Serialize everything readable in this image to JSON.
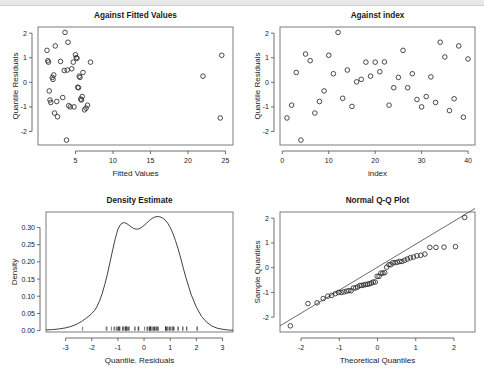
{
  "chart_data": [
    {
      "type": "scatter",
      "title": "Against Fitted Values",
      "xlabel": "Fitted Values",
      "ylabel": "Quantile Residuals",
      "xlim": [
        0.0,
        26.0
      ],
      "ylim": [
        -2.55,
        2.25
      ],
      "xticks": [
        5,
        10,
        15,
        20,
        25
      ],
      "yticks": [
        -2,
        -1,
        0,
        1,
        2
      ],
      "grid": false,
      "legend": "none",
      "x": [
        1.2,
        1.3,
        1.4,
        1.5,
        1.6,
        1.7,
        1.9,
        2.0,
        2.1,
        2.2,
        2.3,
        2.5,
        2.6,
        3.0,
        3.3,
        3.5,
        3.6,
        3.8,
        3.9,
        4.0,
        4.1,
        4.3,
        4.5,
        4.7,
        4.8,
        5.0,
        5.1,
        5.2,
        5.3,
        5.4,
        5.5,
        5.6,
        5.7,
        5.8,
        5.9,
        6.0,
        6.2,
        6.4,
        6.6,
        7.0,
        22.0,
        24.3,
        24.5
      ],
      "y": [
        1.3,
        0.88,
        0.82,
        -0.35,
        -0.72,
        -0.82,
        0.2,
        0.12,
        0.3,
        -1.25,
        1.48,
        -0.78,
        -1.4,
        0.85,
        -0.62,
        0.48,
        2.03,
        -2.35,
        0.5,
        1.63,
        -0.95,
        -1.0,
        0.55,
        0.82,
        -1.0,
        1.12,
        1.0,
        0.98,
        -0.2,
        -0.22,
        0.25,
        0.2,
        -0.68,
        -0.72,
        -0.58,
        0.4,
        -1.12,
        -1.05,
        -0.93,
        0.82,
        0.25,
        -1.45,
        1.1
      ]
    },
    {
      "type": "scatter",
      "title": "Against  index",
      "xlabel": "index",
      "ylabel": "Quantile Residuals",
      "xlim": [
        -0.5,
        41.5
      ],
      "ylim": [
        -2.55,
        2.25
      ],
      "xticks": [
        0,
        10,
        20,
        30,
        40
      ],
      "yticks": [
        -2,
        -1,
        0,
        1,
        2
      ],
      "grid": false,
      "legend": "none",
      "x": [
        1,
        2,
        3,
        4,
        5,
        6,
        7,
        8,
        9,
        10,
        11,
        12,
        13,
        14,
        15,
        16,
        17,
        18,
        19,
        20,
        21,
        22,
        23,
        24,
        25,
        26,
        27,
        28,
        29,
        30,
        31,
        32,
        33,
        34,
        35,
        36,
        37,
        38,
        39,
        40
      ],
      "y": [
        -1.45,
        -0.93,
        0.4,
        -2.35,
        1.15,
        0.88,
        -1.25,
        -0.78,
        -0.35,
        1.1,
        0.35,
        2.03,
        -0.65,
        0.5,
        -0.98,
        0.02,
        0.12,
        0.82,
        0.25,
        0.82,
        0.43,
        0.83,
        -0.93,
        -0.22,
        0.2,
        1.3,
        -0.22,
        0.35,
        -0.7,
        -1.0,
        -0.58,
        0.22,
        -0.82,
        1.63,
        1.03,
        -1.15,
        -0.67,
        1.48,
        -1.42,
        0.95
      ]
    },
    {
      "type": "line",
      "title": "Density Estimate",
      "xlabel": "Quantile. Residuals",
      "ylabel": "Density",
      "xlim": [
        -3.75,
        3.4
      ],
      "ylim": [
        -0.004,
        0.345
      ],
      "xticks": [
        -3,
        -2,
        -1,
        0,
        1,
        2,
        3
      ],
      "yticks": [
        0.0,
        0.05,
        0.1,
        0.15,
        0.2,
        0.25,
        0.3
      ],
      "ytick_labels": [
        "0.00",
        "0.05",
        "0.10",
        "0.15",
        "0.20",
        "0.25",
        "0.30"
      ],
      "grid": false,
      "legend": "none",
      "x": [
        -3.75,
        -3.5,
        -3.25,
        -3.0,
        -2.8,
        -2.6,
        -2.4,
        -2.25,
        -2.1,
        -2.0,
        -1.9,
        -1.8,
        -1.7,
        -1.6,
        -1.5,
        -1.4,
        -1.3,
        -1.2,
        -1.1,
        -1.0,
        -0.9,
        -0.8,
        -0.7,
        -0.6,
        -0.5,
        -0.4,
        -0.3,
        -0.2,
        -0.1,
        0.0,
        0.1,
        0.2,
        0.3,
        0.4,
        0.5,
        0.6,
        0.7,
        0.8,
        0.9,
        1.0,
        1.1,
        1.2,
        1.3,
        1.4,
        1.5,
        1.6,
        1.8,
        2.0,
        2.2,
        2.4,
        2.6,
        2.8,
        3.0,
        3.2,
        3.4
      ],
      "y": [
        0.002,
        0.003,
        0.005,
        0.008,
        0.012,
        0.018,
        0.026,
        0.034,
        0.043,
        0.05,
        0.058,
        0.07,
        0.087,
        0.108,
        0.135,
        0.165,
        0.2,
        0.235,
        0.268,
        0.295,
        0.309,
        0.314,
        0.313,
        0.308,
        0.302,
        0.297,
        0.295,
        0.296,
        0.3,
        0.306,
        0.313,
        0.32,
        0.326,
        0.33,
        0.332,
        0.331,
        0.328,
        0.322,
        0.313,
        0.3,
        0.283,
        0.262,
        0.238,
        0.211,
        0.182,
        0.154,
        0.105,
        0.068,
        0.041,
        0.024,
        0.013,
        0.007,
        0.004,
        0.002,
        0.001
      ],
      "rug": [
        -2.35,
        -1.45,
        -1.42,
        -1.25,
        -1.15,
        -1.12,
        -1.05,
        -1.0,
        -1.0,
        -0.98,
        -0.95,
        -0.93,
        -0.93,
        -0.82,
        -0.82,
        -0.78,
        -0.72,
        -0.72,
        -0.7,
        -0.68,
        -0.67,
        -0.65,
        -0.62,
        -0.58,
        -0.58,
        -0.35,
        -0.35,
        -0.22,
        -0.22,
        -0.2,
        0.02,
        0.12,
        0.12,
        0.2,
        0.2,
        0.2,
        0.22,
        0.25,
        0.25,
        0.25,
        0.3,
        0.35,
        0.35,
        0.4,
        0.4,
        0.43,
        0.48,
        0.5,
        0.5,
        0.55,
        0.82,
        0.82,
        0.82,
        0.83,
        0.85,
        0.88,
        0.88,
        0.95,
        0.98,
        1.0,
        1.03,
        1.1,
        1.1,
        1.12,
        1.15,
        1.3,
        1.3,
        1.48,
        1.48,
        1.63,
        1.63,
        2.03,
        2.03
      ]
    },
    {
      "type": "scatter",
      "title": "Normal Q-Q Plot",
      "xlabel": "Theoretical Quantiles",
      "ylabel": "Sample Quantiles",
      "xlim": [
        -2.55,
        2.55
      ],
      "ylim": [
        -2.6,
        2.25
      ],
      "xticks": [
        -2,
        -1,
        0,
        1,
        2
      ],
      "yticks": [
        -2,
        -1,
        0,
        1,
        2
      ],
      "grid": false,
      "legend": "none",
      "reference_line": {
        "slope": 0.93,
        "intercept": 0.02
      },
      "x": [
        -2.28,
        -1.82,
        -1.58,
        -1.42,
        -1.3,
        -1.2,
        -1.1,
        -1.02,
        -0.95,
        -0.88,
        -0.81,
        -0.75,
        -0.69,
        -0.63,
        -0.57,
        -0.52,
        -0.46,
        -0.41,
        -0.36,
        -0.31,
        -0.26,
        -0.21,
        -0.16,
        -0.11,
        -0.06,
        -0.01,
        0.04,
        0.09,
        0.14,
        0.19,
        0.24,
        0.3,
        0.35,
        0.4,
        0.46,
        0.52,
        0.58,
        0.64,
        0.71,
        0.78,
        0.86,
        0.94,
        1.03,
        1.13,
        1.24,
        1.37,
        1.53,
        1.74,
        2.04,
        2.28
      ],
      "y": [
        -2.35,
        -1.45,
        -1.42,
        -1.25,
        -1.15,
        -1.12,
        -1.05,
        -1.0,
        -1.0,
        -0.98,
        -0.95,
        -0.93,
        -0.93,
        -0.82,
        -0.82,
        -0.78,
        -0.72,
        -0.72,
        -0.7,
        -0.68,
        -0.67,
        -0.65,
        -0.62,
        -0.58,
        -0.58,
        -0.35,
        -0.35,
        -0.22,
        -0.22,
        -0.2,
        0.02,
        0.12,
        0.12,
        0.2,
        0.2,
        0.22,
        0.25,
        0.25,
        0.3,
        0.35,
        0.4,
        0.43,
        0.48,
        0.5,
        0.55,
        0.82,
        0.82,
        0.83,
        0.85,
        2.03
      ]
    }
  ],
  "panels": {
    "fitted": {
      "title": "Against Fitted Values",
      "xlabel": "Fitted Values",
      "ylabel": "Quantile Residuals"
    },
    "index": {
      "title": "Against  index",
      "xlabel": "index",
      "ylabel": "Quantile Residuals"
    },
    "density": {
      "title": "Density Estimate",
      "xlabel": "Quantile. Residuals",
      "ylabel": "Density"
    },
    "qq": {
      "title": "Normal Q-Q Plot",
      "xlabel": "Theoretical Quantiles",
      "ylabel": "Sample Quantiles"
    }
  },
  "style": {
    "point_color": "#2b2b2b",
    "line_color": "#2b2b2b",
    "frame_color": "#6e6e6e",
    "text_color": "#1a1a1a",
    "background": "#ffffff",
    "topbar_color": "#e8e8e8"
  }
}
